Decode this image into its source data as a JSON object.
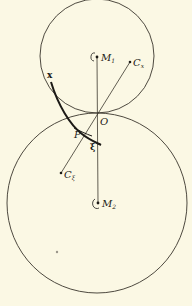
{
  "figure": {
    "type": "geometric-diagram",
    "colors": {
      "background": "#fbf8e4",
      "ink": "#2a2720"
    },
    "circles": [
      {
        "name": "upper-circle",
        "center_label": "M1",
        "cx": 97,
        "cy": 56,
        "r": 57
      },
      {
        "name": "lower-circle",
        "center_label": "M2",
        "cx": 97,
        "cy": 203,
        "r": 90
      }
    ],
    "labels": {
      "M1": "M",
      "M1_sub": "1",
      "M2": "M",
      "M2_sub": "2",
      "Cx": "C",
      "Cx_sub": "x",
      "Cxi": "C",
      "Cxi_sub": "ξ",
      "O": "O",
      "P": "P",
      "x": "x",
      "xi": "ξ"
    },
    "points": {
      "M1": [
        97,
        57
      ],
      "M2": [
        98,
        203
      ],
      "Cx": [
        130,
        62
      ],
      "Cxi": [
        61,
        173
      ],
      "O": [
        97,
        113
      ],
      "P": [
        80,
        133
      ],
      "stray_dot": [
        57,
        252
      ]
    }
  }
}
